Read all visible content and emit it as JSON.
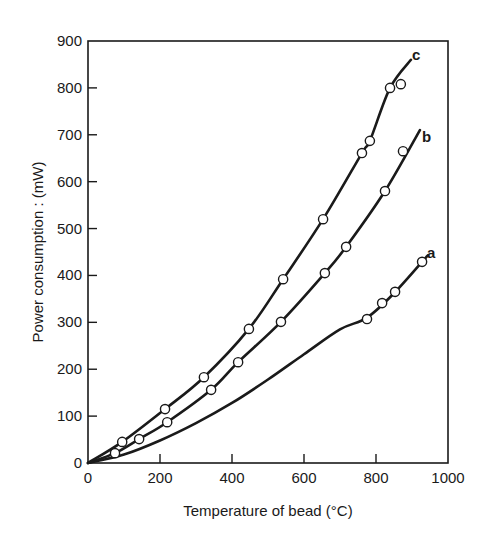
{
  "chart_data": {
    "type": "line",
    "title": "",
    "xlabel": "Temperature of bead (°C)",
    "ylabel": "Power consumption : (mW)",
    "xlim": [
      0,
      1000
    ],
    "ylim": [
      0,
      900
    ],
    "x_ticks": [
      0,
      200,
      400,
      600,
      800,
      1000
    ],
    "y_ticks": [
      0,
      100,
      200,
      300,
      400,
      500,
      600,
      700,
      800,
      900
    ],
    "grid": false,
    "legend": "inline labels at curve ends",
    "series": [
      {
        "name": "a",
        "curve": [
          [
            0,
            0
          ],
          [
            100,
            18
          ],
          [
            200,
            48
          ],
          [
            300,
            85
          ],
          [
            400,
            128
          ],
          [
            500,
            178
          ],
          [
            600,
            232
          ],
          [
            700,
            285
          ],
          [
            775,
            310
          ],
          [
            850,
            362
          ],
          [
            944,
            443
          ]
        ],
        "points": [
          [
            775,
            307
          ],
          [
            817,
            341
          ],
          [
            853,
            365
          ],
          [
            928,
            429
          ]
        ]
      },
      {
        "name": "b",
        "curve": [
          [
            0,
            0
          ],
          [
            75,
            21
          ],
          [
            142,
            51
          ],
          [
            220,
            87
          ],
          [
            342,
            156
          ],
          [
            417,
            215
          ],
          [
            536,
            301
          ],
          [
            658,
            405
          ],
          [
            717,
            461
          ],
          [
            825,
            580
          ],
          [
            922,
            710
          ]
        ],
        "points": [
          [
            75,
            21
          ],
          [
            142,
            51
          ],
          [
            220,
            87
          ],
          [
            342,
            156
          ],
          [
            417,
            215
          ],
          [
            536,
            301
          ],
          [
            658,
            405
          ],
          [
            717,
            461
          ],
          [
            825,
            580
          ],
          [
            875,
            665
          ]
        ]
      },
      {
        "name": "c",
        "curve": [
          [
            0,
            0
          ],
          [
            95,
            45
          ],
          [
            214,
            115
          ],
          [
            322,
            183
          ],
          [
            447,
            286
          ],
          [
            542,
            392
          ],
          [
            653,
            520
          ],
          [
            761,
            661
          ],
          [
            783,
            687
          ],
          [
            839,
            800
          ],
          [
            897,
            860
          ]
        ],
        "points": [
          [
            95,
            45
          ],
          [
            214,
            115
          ],
          [
            322,
            183
          ],
          [
            447,
            286
          ],
          [
            542,
            392
          ],
          [
            653,
            520
          ],
          [
            761,
            661
          ],
          [
            783,
            687
          ],
          [
            839,
            800
          ],
          [
            869,
            808
          ]
        ]
      }
    ]
  },
  "labels": {
    "xlabel": "Temperature of bead (°C)",
    "ylabel": "Power consumption : (mW)",
    "curve_a": "a",
    "curve_b": "b",
    "curve_c": "c"
  }
}
